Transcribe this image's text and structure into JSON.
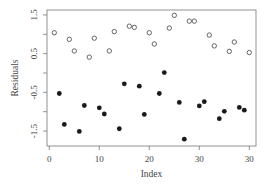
{
  "chart_data": {
    "type": "scatter",
    "title": "",
    "xlabel": "Index",
    "ylabel": "Residuals",
    "xlim": [
      0,
      41
    ],
    "ylim": [
      -1.75,
      1.6
    ],
    "x_ticks": [
      0,
      10,
      20,
      30,
      40
    ],
    "x_tick_labels": [
      "0",
      "10",
      "20",
      "30",
      "30"
    ],
    "y_ticks": [
      -1.5,
      -1.0,
      -0.5,
      0.0,
      0.5,
      1.0,
      1.5
    ],
    "y_tick_labels": [
      "-1.5",
      "",
      "-0.5",
      "",
      "0.5",
      "",
      "1.5"
    ],
    "grid": false,
    "legend": null,
    "series": [
      {
        "name": "open",
        "marker": "open-circle",
        "color": "#555555",
        "points": [
          [
            1,
            1.04
          ],
          [
            4,
            0.87
          ],
          [
            5,
            0.57
          ],
          [
            8,
            0.41
          ],
          [
            9,
            0.9
          ],
          [
            12,
            0.57
          ],
          [
            13,
            1.07
          ],
          [
            16,
            1.21
          ],
          [
            17,
            1.18
          ],
          [
            20,
            1.04
          ],
          [
            21,
            0.75
          ],
          [
            24,
            1.16
          ],
          [
            25,
            1.49
          ],
          [
            28,
            1.34
          ],
          [
            29,
            1.34
          ],
          [
            32,
            0.98
          ],
          [
            33,
            0.7
          ],
          [
            36,
            0.56
          ],
          [
            37,
            0.8
          ],
          [
            40,
            0.53
          ]
        ]
      },
      {
        "name": "filled",
        "marker": "filled-circle",
        "color": "#1a1a1a",
        "points": [
          [
            2,
            -0.53
          ],
          [
            3,
            -1.33
          ],
          [
            6,
            -1.51
          ],
          [
            7,
            -0.84
          ],
          [
            10,
            -0.9
          ],
          [
            11,
            -1.06
          ],
          [
            14,
            -1.44
          ],
          [
            15,
            -0.28
          ],
          [
            18,
            -0.34
          ],
          [
            19,
            -1.07
          ],
          [
            22,
            -0.53
          ],
          [
            23,
            0.01
          ],
          [
            26,
            -0.76
          ],
          [
            27,
            -1.71
          ],
          [
            30,
            -0.85
          ],
          [
            31,
            -0.74
          ],
          [
            34,
            -1.18
          ],
          [
            35,
            -0.99
          ],
          [
            38,
            -0.89
          ],
          [
            39,
            -0.96
          ]
        ]
      }
    ]
  }
}
